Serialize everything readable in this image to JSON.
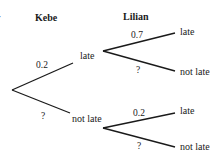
{
  "diagram": {
    "type": "probability-tree",
    "clipped_left_text": "r",
    "headers": {
      "stage1": "Kebe",
      "stage2": "Lilian"
    },
    "stage1": {
      "branches": [
        {
          "outcome": "late",
          "probability": "0.2"
        },
        {
          "outcome": "not late",
          "probability": "?"
        }
      ]
    },
    "stage2": {
      "given_late": {
        "branches": [
          {
            "outcome": "late",
            "probability": "0.7"
          },
          {
            "outcome": "not late",
            "probability": "?"
          }
        ]
      },
      "given_not_late": {
        "branches": [
          {
            "outcome": "late",
            "probability": "0.2"
          },
          {
            "outcome": "not late",
            "probability": "?"
          }
        ]
      }
    },
    "colors": {
      "line": "#1a1a1a",
      "text": "#1a1a1a",
      "background": "#ffffff"
    }
  }
}
